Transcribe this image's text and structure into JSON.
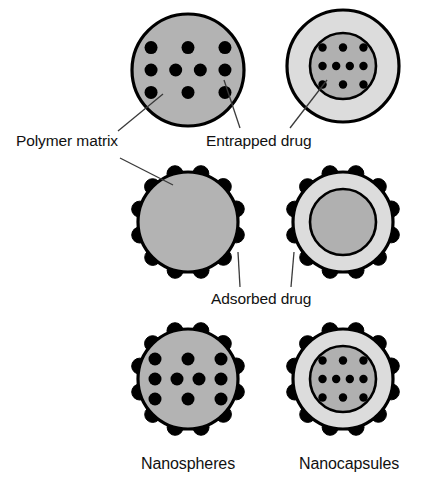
{
  "figure": {
    "background": "#ffffff"
  },
  "colors": {
    "matrix_gray": "#b3b3b3",
    "shell_light_gray": "#dcdcdc",
    "core_gray": "#b0b0b0",
    "outline": "#000000",
    "drug_dot": "#000000",
    "leader_line": "#3a3a3a",
    "text": "#111111"
  },
  "labels": {
    "polymer_matrix": "Polymer matrix",
    "entrapped_drug": "Entrapped drug",
    "adsorbed_drug": "Adsorbed drug",
    "nanospheres": "Nanospheres",
    "nanocapsules": "Nanocapsules"
  },
  "columns": [
    {
      "id": "nanospheres",
      "label": "Nanospheres",
      "cx": 188
    },
    {
      "id": "nanocapsules",
      "label": "Nanocapsules",
      "cx": 343
    }
  ],
  "rows": [
    {
      "id": "entrapped-only",
      "cy": 70,
      "has_internal_drug": true,
      "has_surface_drug": false
    },
    {
      "id": "adsorbed-only",
      "cy": 222,
      "has_internal_drug": false,
      "has_surface_drug": true
    },
    {
      "id": "entrapped-and-adsorbed",
      "cy": 379,
      "has_internal_drug": true,
      "has_surface_drug": true
    }
  ],
  "particles": [
    {
      "name": "nanosphere-entrapped",
      "type": "nanosphere",
      "cx": 188,
      "cy": 70,
      "r": 56,
      "fill": "#b3b3b3",
      "internal_dots": {
        "rows": [
          3,
          4,
          3
        ],
        "radius": 6.5
      },
      "surface_dots": {
        "count": 0,
        "radius": 0
      }
    },
    {
      "name": "nanocapsule-entrapped",
      "type": "nanocapsule",
      "cx": 343,
      "cy": 66,
      "r": 56,
      "core_r": 33,
      "fill": "#dcdcdc",
      "core_fill": "#b0b0b0",
      "internal_dots": {
        "rows": [
          3,
          4,
          3
        ],
        "radius": 4.2
      },
      "surface_dots": {
        "count": 0,
        "radius": 0
      }
    },
    {
      "name": "nanosphere-adsorbed",
      "type": "nanosphere",
      "cx": 188,
      "cy": 222,
      "r": 50,
      "fill": "#b3b3b3",
      "internal_dots": {
        "rows": [],
        "radius": 0
      },
      "surface_dots": {
        "count": 12,
        "radius": 8
      }
    },
    {
      "name": "nanocapsule-adsorbed",
      "type": "nanocapsule",
      "cx": 343,
      "cy": 222,
      "r": 50,
      "core_r": 33,
      "fill": "#dcdcdc",
      "core_fill": "#b0b0b0",
      "internal_dots": {
        "rows": [],
        "radius": 0
      },
      "surface_dots": {
        "count": 12,
        "radius": 8
      }
    },
    {
      "name": "nanosphere-entrapped-adsorbed",
      "type": "nanosphere",
      "cx": 188,
      "cy": 379,
      "r": 50,
      "fill": "#b3b3b3",
      "internal_dots": {
        "rows": [
          3,
          4,
          3
        ],
        "radius": 6.5
      },
      "surface_dots": {
        "count": 12,
        "radius": 8
      }
    },
    {
      "name": "nanocapsule-entrapped-adsorbed",
      "type": "nanocapsule",
      "cx": 343,
      "cy": 379,
      "r": 50,
      "core_r": 33,
      "fill": "#dcdcdc",
      "core_fill": "#b0b0b0",
      "internal_dots": {
        "rows": [
          3,
          4,
          3
        ],
        "radius": 4.2
      },
      "surface_dots": {
        "count": 12,
        "radius": 8
      }
    }
  ],
  "leaders": [
    {
      "name": "leader-polymer-matrix-top",
      "x1": 118,
      "y1": 131,
      "x2": 163,
      "y2": 94
    },
    {
      "name": "leader-polymer-matrix-middle",
      "x1": 120,
      "y1": 158,
      "x2": 173,
      "y2": 185
    },
    {
      "name": "leader-entrapped-left",
      "x1": 240,
      "y1": 128,
      "x2": 224,
      "y2": 80
    },
    {
      "name": "leader-entrapped-right",
      "x1": 290,
      "y1": 128,
      "x2": 327,
      "y2": 80
    },
    {
      "name": "leader-adsorbed-left",
      "x1": 240,
      "y1": 287,
      "x2": 238,
      "y2": 252
    },
    {
      "name": "leader-adsorbed-right",
      "x1": 291,
      "y1": 287,
      "x2": 294,
      "y2": 252
    }
  ]
}
